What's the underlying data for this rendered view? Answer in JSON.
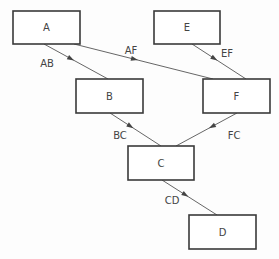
{
  "diagram": {
    "type": "directed-graph",
    "nodes": [
      {
        "id": "A",
        "label": "A"
      },
      {
        "id": "E",
        "label": "E"
      },
      {
        "id": "B",
        "label": "B"
      },
      {
        "id": "F",
        "label": "F"
      },
      {
        "id": "C",
        "label": "C"
      },
      {
        "id": "D",
        "label": "D"
      }
    ],
    "edges": [
      {
        "id": "AB",
        "from": "A",
        "to": "B",
        "label": "AB"
      },
      {
        "id": "AF",
        "from": "A",
        "to": "F",
        "label": "AF"
      },
      {
        "id": "EF",
        "from": "E",
        "to": "F",
        "label": "EF"
      },
      {
        "id": "BC",
        "from": "B",
        "to": "C",
        "label": "BC"
      },
      {
        "id": "FC",
        "from": "F",
        "to": "C",
        "label": "FC"
      },
      {
        "id": "CD",
        "from": "C",
        "to": "D",
        "label": "CD"
      }
    ]
  }
}
